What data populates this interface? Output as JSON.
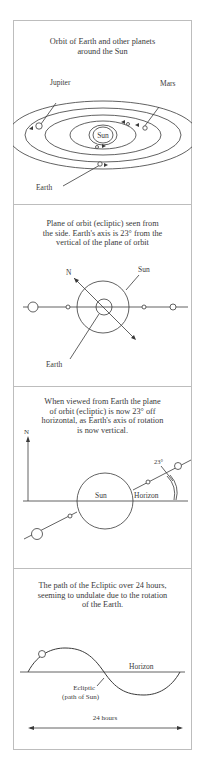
{
  "panels": [
    {
      "caption": [
        "Orbit of Earth and other planets",
        "around the Sun"
      ],
      "labels": {
        "jupiter": "Jupiter",
        "mars": "Mars",
        "sun": "Sun",
        "earth": "Earth"
      }
    },
    {
      "caption": [
        "Plane of orbit (ecliptic) seen from",
        "the side. Earth's axis is 23° from the",
        "vertical of the plane of orbit"
      ],
      "labels": {
        "north": "N",
        "sun": "Sun",
        "earth": "Earth"
      }
    },
    {
      "caption": [
        "When viewed from Earth the plane",
        "of orbit (ecliptic) is now 23° off",
        "horizontal, as Earth's axis of rotation",
        "is now vertical."
      ],
      "labels": {
        "north": "N",
        "sun": "Sun",
        "horizon": "Horizon",
        "angle": "23°"
      }
    },
    {
      "caption": [
        "The path of the Ecliptic over 24 hours,",
        "seeming to undulate due to the rotation",
        "of the Earth."
      ],
      "labels": {
        "horizon": "Horizon",
        "ecliptic_line1": "Ecliptic",
        "ecliptic_line2": "(path of Sun)",
        "duration": "24 hours"
      }
    }
  ],
  "colors": {
    "line": "#3a3a3a",
    "border": "#bdbdbd",
    "background": "#ffffff"
  }
}
